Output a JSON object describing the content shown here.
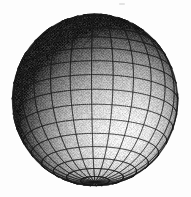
{
  "figure": {
    "title": "Shaded wireframe sphere",
    "caption": "Grayscale rendered sphere with latitude-longitude quad mesh",
    "width": 191,
    "height": 197,
    "background_color": "#fdfdfd"
  },
  "chart_data": {
    "type": "scatter",
    "title": "Shaded wireframe sphere",
    "subtitle": "",
    "xlabel": "",
    "ylabel": "",
    "grid": true,
    "legend_position": "none",
    "xlim": [
      12,
      178
    ],
    "ylim": [
      14,
      186
    ],
    "tick_labels_x": [],
    "tick_labels_y": [],
    "annotations": [],
    "geometry": {
      "shape": "sphere",
      "center_x": 95,
      "center_y": 100,
      "radius_x": 83,
      "radius_y": 86,
      "projection": "orthographic"
    },
    "mesh": {
      "meridians": 24,
      "parallels": 18,
      "line_color": "#2a2a2a",
      "line_width": 1.0,
      "visible_meridians": 15,
      "visible_parallels": 17
    },
    "shading": {
      "model": "lambert-diffuse",
      "light_direction_x": -0.42,
      "light_direction_y": -0.52,
      "light_direction_z": 0.74,
      "ambient": 0.1,
      "specular": 0.0,
      "highlight_x": 75,
      "highlight_y": 58,
      "terminator_x": 150,
      "terminator_y": 160,
      "min_gray": "#0a0a0a",
      "max_gray": "#fafafa",
      "dither": "halftone",
      "dither_amount": 0.16
    },
    "tone_samples": [
      {
        "label": "highlight-upper-left-center",
        "x": 75,
        "y": 58,
        "gray": 247
      },
      {
        "label": "upper-left-rim",
        "x": 40,
        "y": 40,
        "gray": 150
      },
      {
        "label": "left-limb",
        "x": 20,
        "y": 100,
        "gray": 168
      },
      {
        "label": "center",
        "x": 95,
        "y": 100,
        "gray": 196
      },
      {
        "label": "equator-band",
        "x": 95,
        "y": 118,
        "gray": 176
      },
      {
        "label": "upper-right",
        "x": 140,
        "y": 55,
        "gray": 96
      },
      {
        "label": "right-limb",
        "x": 170,
        "y": 100,
        "gray": 42
      },
      {
        "label": "lower-left",
        "x": 45,
        "y": 150,
        "gray": 108
      },
      {
        "label": "bottom",
        "x": 95,
        "y": 172,
        "gray": 46
      },
      {
        "label": "lower-right-terminator",
        "x": 150,
        "y": 155,
        "gray": 16
      },
      {
        "label": "background",
        "x": 5,
        "y": 5,
        "gray": 253
      }
    ]
  },
  "artifacts": {
    "speck": {
      "name": "dust-speck",
      "x": 119,
      "y": 3,
      "color": "#dedede"
    }
  }
}
